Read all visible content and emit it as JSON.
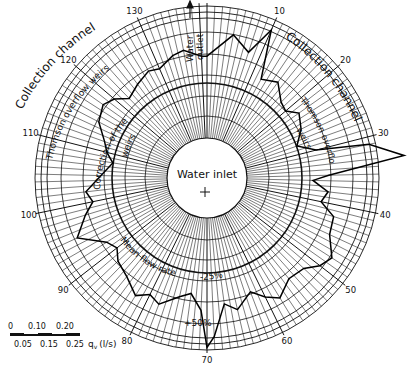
{
  "chart_data": {
    "type": "polar-line",
    "title": "",
    "center_label": "Water inlet",
    "angular_unit": "weir number (1-138, clockwise from top)",
    "angular_ticks": [
      1,
      10,
      20,
      30,
      40,
      50,
      60,
      70,
      80,
      90,
      100,
      110,
      120,
      130,
      138
    ],
    "radial_quantity": "q_v (l/s)",
    "scale_bar": {
      "top_ticks": [
        "0",
        "0.10",
        "0.20"
      ],
      "bottom_ticks": [
        "0.05",
        "0.15",
        "0.25"
      ],
      "unit_label": "q_v (l/s)"
    },
    "reference_circles": {
      "mean_flow_rate": "Mean flow rate",
      "minus_25": "-25%",
      "plus_50": "+50%"
    },
    "annotations": [
      "Collection channel",
      "Collection channel",
      "Thomson overflow weirs",
      "Thomson overflow weirs",
      "Correction of the weirs",
      "Water outlet"
    ],
    "series": [
      {
        "name": "Flow per weir (relative radius)",
        "weirs": [
          1,
          5,
          8,
          10,
          12,
          15,
          18,
          20,
          22,
          25,
          28,
          30,
          31,
          33,
          35,
          36,
          38,
          40,
          42,
          45,
          48,
          50,
          52,
          55,
          58,
          60,
          62,
          65,
          67,
          69,
          70,
          71,
          73,
          75,
          78,
          80,
          82,
          85,
          88,
          90,
          92,
          95,
          98,
          100,
          102,
          105,
          108,
          110,
          112,
          115,
          118,
          120,
          122,
          125,
          128,
          130,
          133,
          135,
          138
        ],
        "values": [
          0.62,
          0.8,
          0.7,
          0.92,
          0.55,
          0.6,
          0.5,
          0.48,
          0.55,
          0.5,
          0.42,
          0.55,
          0.95,
          1.2,
          0.62,
          0.5,
          0.62,
          0.58,
          0.7,
          0.72,
          0.82,
          0.78,
          0.7,
          0.68,
          0.76,
          0.7,
          0.62,
          0.72,
          0.66,
          0.9,
          0.98,
          0.7,
          0.58,
          0.62,
          0.72,
          0.68,
          0.74,
          0.66,
          0.62,
          0.56,
          0.6,
          0.78,
          0.66,
          0.58,
          0.62,
          0.5,
          0.42,
          0.48,
          0.52,
          0.62,
          0.66,
          0.62,
          0.54,
          0.58,
          0.62,
          0.6,
          0.66,
          0.68,
          0.62
        ]
      }
    ]
  },
  "labels": {
    "water_inlet": "Water inlet",
    "water_outlet_1": "Water",
    "water_outlet_2": "outlet",
    "collection_left": "Collection channel",
    "collection_right": "Collection channel",
    "thomson_left": "Thomson overflow weirs",
    "thomson_right_1": "Thomson overflow",
    "thomson_right_2": "weirs",
    "correction_1": "Correction of the",
    "correction_2": "weirs",
    "mean_flow": "Mean flow rate",
    "minus25": "-25%",
    "plus50": "+50%",
    "scale_unit": "q",
    "scale_sub": "v",
    "scale_unit_rest": "(l/s)"
  }
}
